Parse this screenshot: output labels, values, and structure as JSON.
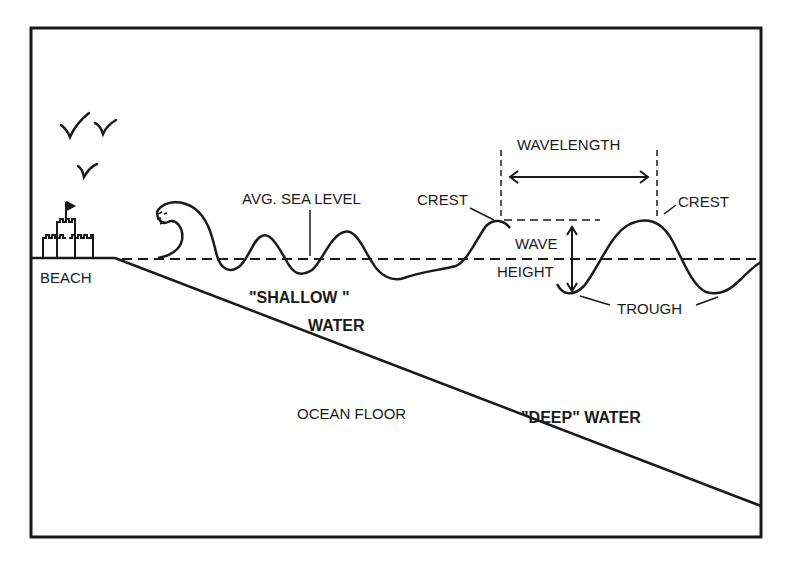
{
  "diagram": {
    "title_labels": {
      "beach": "BEACH",
      "avg_sea_level": "AVG. SEA LEVEL",
      "crest_left": "CREST",
      "crest_right": "CREST",
      "wavelength": "WAVELENGTH",
      "wave": "WAVE",
      "height": "HEIGHT",
      "trough": "TROUGH",
      "shallow_line1": "\"SHALLOW \"",
      "shallow_line2": "WATER",
      "ocean_floor": "OCEAN FLOOR",
      "deep_water": "\"DEEP\" WATER"
    },
    "icons": [
      "bird-icon",
      "bird-icon",
      "bird-icon",
      "sandcastle-icon",
      "breaking-wave-icon"
    ],
    "ink_color": "#1a1a1a",
    "background_color": "#ffffff"
  }
}
